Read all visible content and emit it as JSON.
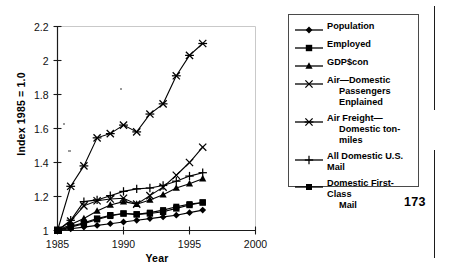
{
  "folio": {
    "page_number": "173"
  },
  "legend": {
    "entries": [
      {
        "label": "Population",
        "marker": "diamond",
        "label_line1": "Population",
        "label_line2": ""
      },
      {
        "label": "Employed",
        "marker": "square",
        "label_line1": "Employed",
        "label_line2": ""
      },
      {
        "label": "GDP$con",
        "marker": "triangle",
        "label_line1": "GDP$con",
        "label_line2": ""
      },
      {
        "label": "Air—Domestic Passengers Enplained",
        "marker": "cross-x",
        "label_line1": "Air—Domestic",
        "label_line2": "Passengers Enplained"
      },
      {
        "label": "Air Freight—Domestic ton-miles",
        "marker": "asterisk",
        "label_line1": "Air Freight—",
        "label_line2": "Domestic ton-miles"
      },
      {
        "label": "All Domestic U.S. Mail",
        "marker": "plus",
        "label_line1": "All Domestic U.S. Mail",
        "label_line2": ""
      },
      {
        "label": "Domestic First-Class Mail",
        "marker": "square-sm",
        "label_line1": "Domestic First-Class",
        "label_line2": "Mail"
      }
    ]
  },
  "chart_data": {
    "type": "line",
    "title": "",
    "xlabel": "Year",
    "ylabel": "Index 1985 = 1.0",
    "xlim": [
      1985,
      2000
    ],
    "ylim": [
      1.0,
      2.2
    ],
    "xticks": [
      1985,
      1990,
      1995,
      2000
    ],
    "xtick_labels": [
      "1985",
      "1990",
      "1995",
      "2000"
    ],
    "yticks": [
      1,
      1.2,
      1.4,
      1.6,
      1.8,
      2,
      2.2
    ],
    "ytick_labels": [
      "1",
      "1.2",
      "1.4",
      "1.6",
      "1.8",
      "2",
      "2.2"
    ],
    "grid": false,
    "legend_position": "right-outside",
    "x": [
      1985,
      1986,
      1987,
      1988,
      1989,
      1990,
      1991,
      1992,
      1993,
      1994,
      1995,
      1996
    ],
    "series": [
      {
        "name": "Population",
        "marker": "diamond",
        "values": [
          1.0,
          1.01,
          1.02,
          1.03,
          1.04,
          1.05,
          1.06,
          1.07,
          1.08,
          1.09,
          1.105,
          1.12
        ]
      },
      {
        "name": "Employed",
        "marker": "square",
        "values": [
          1.0,
          1.025,
          1.045,
          1.07,
          1.09,
          1.1,
          1.095,
          1.1,
          1.11,
          1.13,
          1.15,
          1.165
        ]
      },
      {
        "name": "GDP$con",
        "marker": "triangle",
        "values": [
          1.0,
          1.035,
          1.07,
          1.115,
          1.15,
          1.17,
          1.155,
          1.18,
          1.21,
          1.25,
          1.275,
          1.305
        ]
      },
      {
        "name": "Air—Domestic Passengers Enplained",
        "marker": "cross-x",
        "values": [
          1.0,
          1.055,
          1.145,
          1.175,
          1.185,
          1.19,
          1.155,
          1.205,
          1.255,
          1.325,
          1.4,
          1.49
        ]
      },
      {
        "name": "Air Freight—Domestic ton-miles",
        "marker": "asterisk",
        "values": [
          1.0,
          1.26,
          1.38,
          1.545,
          1.57,
          1.62,
          1.58,
          1.685,
          1.745,
          1.91,
          2.03,
          2.1
        ]
      },
      {
        "name": "All Domestic U.S. Mail",
        "marker": "plus",
        "values": [
          1.0,
          1.06,
          1.17,
          1.18,
          1.205,
          1.23,
          1.245,
          1.25,
          1.265,
          1.29,
          1.32,
          1.34
        ]
      },
      {
        "name": "Domestic First-Class Mail",
        "marker": "square-sm",
        "values": [
          1.0,
          1.02,
          1.04,
          1.065,
          1.085,
          1.1,
          1.095,
          1.105,
          1.12,
          1.14,
          1.155,
          1.165
        ]
      }
    ]
  }
}
